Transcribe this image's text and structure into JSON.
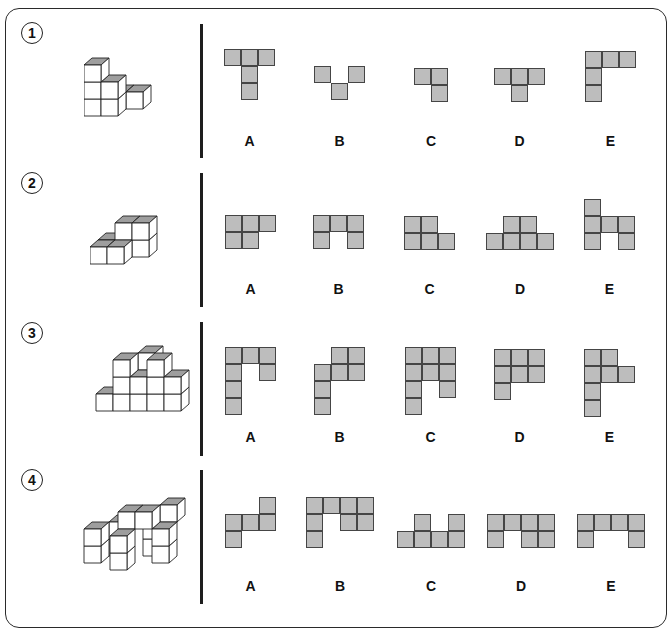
{
  "colors": {
    "cell_fill": "#bdbdbd",
    "cell_border": "#454545",
    "cube_top": "#9e9e9e",
    "cube_face": "#ffffff",
    "line": "#222222"
  },
  "questions": [
    {
      "number": "1",
      "top": 22,
      "divider_top": 24,
      "divider_height": 134,
      "figure": {
        "x": 84,
        "y": 40,
        "cubes": [
          [
            0,
            0,
            0
          ],
          [
            0,
            0,
            1
          ],
          [
            0,
            0,
            2
          ],
          [
            1,
            0,
            0
          ],
          [
            1,
            0,
            1
          ],
          [
            1,
            1,
            0
          ],
          [
            2,
            1,
            0
          ]
        ]
      },
      "options": [
        {
          "label": "A",
          "x": 224,
          "grid_y": 49,
          "grid": [
            [
              1,
              1,
              1
            ],
            [
              0,
              1,
              0
            ],
            [
              0,
              1,
              0
            ]
          ]
        },
        {
          "label": "B",
          "x": 314,
          "grid_y": 66,
          "grid": [
            [
              1,
              0,
              1
            ],
            [
              0,
              1,
              0
            ]
          ]
        },
        {
          "label": "C",
          "x": 414,
          "grid_y": 68,
          "grid": [
            [
              1,
              1
            ],
            [
              0,
              1
            ]
          ]
        },
        {
          "label": "D",
          "x": 494,
          "grid_y": 68,
          "grid": [
            [
              1,
              1,
              1
            ],
            [
              0,
              1,
              0
            ]
          ]
        },
        {
          "label": "E",
          "x": 585,
          "grid_y": 51,
          "grid": [
            [
              1,
              1,
              1
            ],
            [
              1,
              0,
              0
            ],
            [
              1,
              0,
              0
            ]
          ]
        }
      ],
      "label_y": 133
    },
    {
      "number": "2",
      "top": 172,
      "divider_top": 173,
      "divider_height": 134,
      "figure": {
        "x": 90,
        "y": 205,
        "cubes": [
          [
            0,
            0,
            0
          ],
          [
            1,
            0,
            0
          ],
          [
            1,
            1,
            0
          ],
          [
            2,
            1,
            0
          ],
          [
            1,
            1,
            1
          ],
          [
            2,
            1,
            1
          ],
          [
            0,
            1,
            0
          ]
        ]
      },
      "options": [
        {
          "label": "A",
          "x": 225,
          "grid_y": 215,
          "grid": [
            [
              1,
              1,
              1
            ],
            [
              1,
              1,
              0
            ]
          ]
        },
        {
          "label": "B",
          "x": 313,
          "grid_y": 215,
          "grid": [
            [
              1,
              1,
              1
            ],
            [
              1,
              0,
              1
            ]
          ]
        },
        {
          "label": "C",
          "x": 404,
          "grid_y": 216,
          "grid": [
            [
              1,
              1,
              0
            ],
            [
              1,
              1,
              1
            ]
          ]
        },
        {
          "label": "D",
          "x": 486,
          "grid_y": 216,
          "grid": [
            [
              0,
              1,
              1,
              0
            ],
            [
              1,
              1,
              1,
              1
            ]
          ]
        },
        {
          "label": "E",
          "x": 584,
          "grid_y": 199,
          "grid": [
            [
              1,
              0,
              0
            ],
            [
              1,
              1,
              1
            ],
            [
              1,
              0,
              1
            ]
          ]
        }
      ],
      "label_y": 281
    },
    {
      "number": "3",
      "top": 322,
      "divider_top": 322,
      "divider_height": 134,
      "figure": {
        "x": 88,
        "y": 342,
        "cubes": [
          [
            0,
            1,
            0
          ],
          [
            1,
            1,
            0
          ],
          [
            2,
            1,
            0
          ],
          [
            1,
            1,
            1
          ],
          [
            2,
            1,
            1
          ],
          [
            1,
            1,
            2
          ],
          [
            3,
            1,
            2
          ],
          [
            3,
            1,
            1
          ],
          [
            3,
            1,
            0
          ],
          [
            2,
            2,
            2
          ],
          [
            4,
            1,
            0
          ],
          [
            4,
            1,
            1
          ]
        ]
      },
      "options": [
        {
          "label": "A",
          "x": 225,
          "grid_y": 347,
          "grid": [
            [
              1,
              1,
              1
            ],
            [
              1,
              0,
              1
            ],
            [
              1,
              0,
              0
            ],
            [
              1,
              0,
              0
            ]
          ]
        },
        {
          "label": "B",
          "x": 314,
          "grid_y": 347,
          "grid": [
            [
              0,
              1,
              1
            ],
            [
              1,
              1,
              1
            ],
            [
              1,
              0,
              0
            ],
            [
              1,
              0,
              0
            ]
          ]
        },
        {
          "label": "C",
          "x": 405,
          "grid_y": 347,
          "grid": [
            [
              1,
              1,
              1
            ],
            [
              1,
              1,
              1
            ],
            [
              1,
              0,
              1
            ],
            [
              1,
              0,
              0
            ]
          ]
        },
        {
          "label": "D",
          "x": 494,
          "grid_y": 349,
          "grid": [
            [
              1,
              1,
              1
            ],
            [
              1,
              1,
              1
            ],
            [
              1,
              0,
              0
            ]
          ]
        },
        {
          "label": "E",
          "x": 584,
          "grid_y": 349,
          "grid": [
            [
              1,
              1,
              0
            ],
            [
              1,
              1,
              1
            ],
            [
              1,
              0,
              0
            ],
            [
              1,
              0,
              0
            ]
          ]
        }
      ],
      "label_y": 429
    },
    {
      "number": "4",
      "top": 469,
      "divider_top": 470,
      "divider_height": 134,
      "figure": {
        "x": 76,
        "y": 494,
        "cubes": [
          [
            0,
            1,
            0
          ],
          [
            0,
            1,
            1
          ],
          [
            1,
            2,
            0
          ],
          [
            1,
            2,
            1
          ],
          [
            2,
            1,
            2
          ],
          [
            2,
            0,
            0
          ],
          [
            2,
            0,
            1
          ],
          [
            3,
            1,
            2
          ],
          [
            3,
            2,
            0
          ],
          [
            3,
            2,
            1
          ],
          [
            4,
            1,
            0
          ],
          [
            4,
            1,
            1
          ],
          [
            4,
            2,
            2
          ]
        ]
      },
      "options": [
        {
          "label": "A",
          "x": 225,
          "grid_y": 497,
          "grid": [
            [
              0,
              0,
              1
            ],
            [
              1,
              1,
              1
            ],
            [
              1,
              0,
              0
            ]
          ]
        },
        {
          "label": "B",
          "x": 306,
          "grid_y": 497,
          "grid": [
            [
              1,
              1,
              1,
              1
            ],
            [
              1,
              0,
              1,
              1
            ],
            [
              1,
              0,
              0,
              0
            ]
          ]
        },
        {
          "label": "C",
          "x": 397,
          "grid_y": 514,
          "grid": [
            [
              0,
              1,
              0,
              1
            ],
            [
              1,
              1,
              1,
              1
            ]
          ]
        },
        {
          "label": "D",
          "x": 487,
          "grid_y": 514,
          "grid": [
            [
              1,
              1,
              1,
              1
            ],
            [
              1,
              0,
              1,
              1
            ]
          ]
        },
        {
          "label": "E",
          "x": 577,
          "grid_y": 514,
          "grid": [
            [
              1,
              1,
              1,
              1
            ],
            [
              1,
              0,
              0,
              1
            ]
          ]
        }
      ],
      "label_y": 578
    }
  ]
}
